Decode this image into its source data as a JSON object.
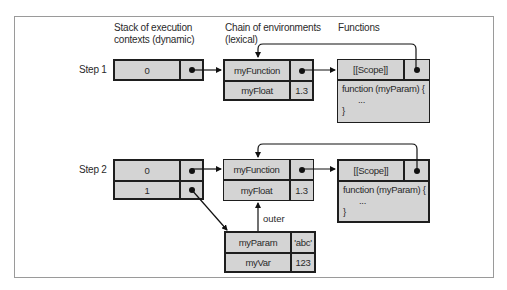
{
  "headers": {
    "stack": [
      "Stack of execution",
      "contexts (dynamic)"
    ],
    "chain": [
      "Chain of environments",
      "(lexical)"
    ],
    "functions": "Functions"
  },
  "step1": {
    "label": "Step 1",
    "stack": [
      {
        "index": "0"
      }
    ],
    "env": [
      {
        "name": "myFunction",
        "value": "pointer"
      },
      {
        "name": "myFloat",
        "value": "1.3"
      }
    ],
    "function": {
      "scope_label": "[[Scope]]",
      "code": [
        "function (myParam) {",
        "...",
        "}"
      ]
    }
  },
  "step2": {
    "label": "Step 2",
    "stack": [
      {
        "index": "0"
      },
      {
        "index": "1"
      }
    ],
    "env": [
      {
        "name": "myFunction",
        "value": "pointer"
      },
      {
        "name": "myFloat",
        "value": "1.3"
      }
    ],
    "function": {
      "scope_label": "[[Scope]]",
      "code": [
        "function (myParam) {",
        "...",
        "}"
      ]
    },
    "outer_label": "outer",
    "inner_env": [
      {
        "name": "myParam",
        "value": "'abc'"
      },
      {
        "name": "myVar",
        "value": "123"
      }
    ]
  },
  "colors": {
    "box_fill": "#d4d4d4",
    "border": "#1e1e1e",
    "frame": "#9a9a9a"
  }
}
